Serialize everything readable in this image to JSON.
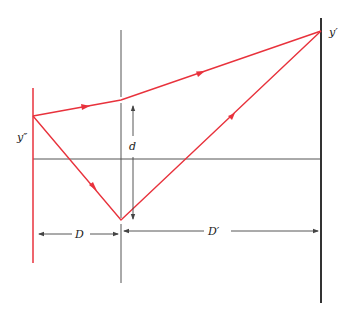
{
  "diagram": {
    "type": "optics-ray-diagram",
    "labels": {
      "y_double_prime": "y″",
      "y_prime": "y′",
      "d": "d",
      "D": "D",
      "D_prime": "D′"
    },
    "colors": {
      "ray": "#e8323c",
      "line": "#333333",
      "dimension": "#444444"
    },
    "elements": [
      "left-screen (red vertical line)",
      "slit-plane (middle vertical line)",
      "right-screen (black vertical line)",
      "optical-axis (horizontal line)",
      "ray from y″ via upper slit to y′",
      "ray from y″ via lower slit to y′"
    ]
  }
}
